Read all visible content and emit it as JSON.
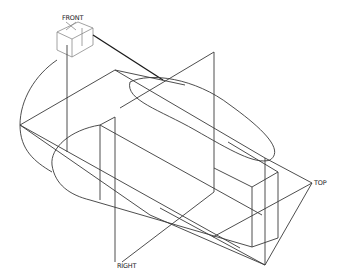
{
  "viewport": {
    "background": "#ffffff",
    "line_color": "#3a3a3a"
  },
  "planes": {
    "front": {
      "label": "FRONT"
    },
    "top": {
      "label": "TOP"
    },
    "right": {
      "label": "RIGHT"
    }
  }
}
